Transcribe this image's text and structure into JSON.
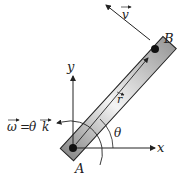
{
  "diagram": {
    "points": {
      "A": "A",
      "B": "B"
    },
    "axes": {
      "x": "x",
      "y": "y"
    },
    "angle": "θ",
    "vectors": {
      "position": "r",
      "velocity": "v",
      "angular_velocity": "ω = θ̇ k"
    },
    "omega_label": {
      "omega": "ω",
      "eq": "=",
      "theta_dot": "θ̇",
      "k": "k"
    }
  }
}
